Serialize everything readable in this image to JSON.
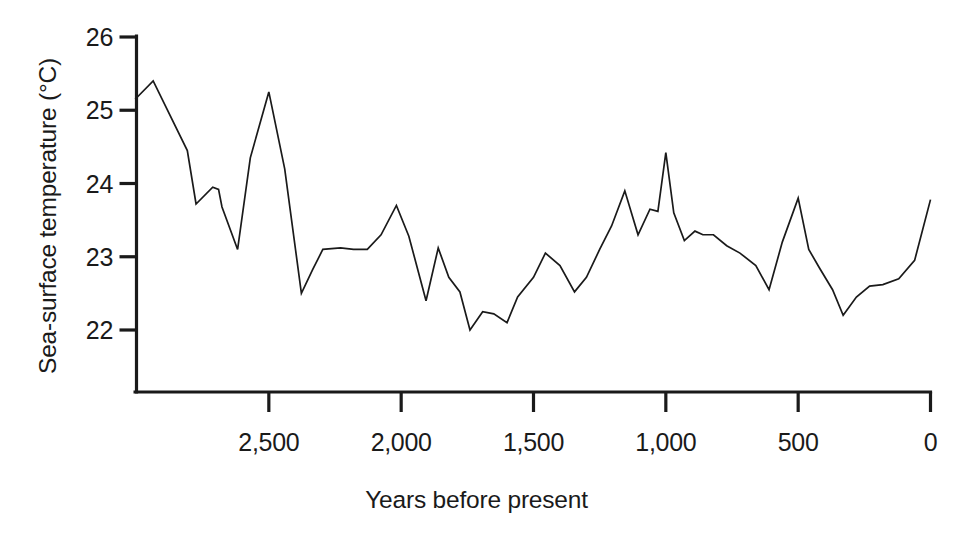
{
  "chart_data": {
    "type": "line",
    "title": "",
    "subtitle": "",
    "xlabel": "Years before present",
    "ylabel": "Sea-surface temperature (°C)",
    "x_tick_labels": [
      "2,500",
      "2,000",
      "1,500",
      "1,000",
      "500",
      "0"
    ],
    "x_tick_values": [
      2500,
      2000,
      1500,
      1000,
      500,
      0
    ],
    "y_tick_labels": [
      "26",
      "25",
      "24",
      "23",
      "22"
    ],
    "y_tick_values": [
      26,
      25,
      24,
      23,
      22
    ],
    "xlim": [
      3000,
      0
    ],
    "ylim": [
      21.4,
      26.2
    ],
    "x_axis_inverted": true,
    "grid": false,
    "legend": null,
    "line_color": "#1a1a1a",
    "background_color": "#ffffff",
    "series": [
      {
        "name": "Sea-surface temperature",
        "x": [
          3005,
          2937,
          2808,
          2775,
          2712,
          2690,
          2677,
          2618,
          2570,
          2500,
          2440,
          2377,
          2335,
          2296,
          2229,
          2180,
          2128,
          2076,
          2018,
          1971,
          1906,
          1860,
          1820,
          1778,
          1740,
          1692,
          1650,
          1600,
          1560,
          1500,
          1455,
          1400,
          1345,
          1300,
          1250,
          1205,
          1155,
          1105,
          1060,
          1030,
          1000,
          970,
          930,
          890,
          860,
          820,
          770,
          720,
          660,
          610,
          560,
          500,
          460,
          420,
          370,
          330,
          280,
          230,
          180,
          120,
          60,
          0
        ],
        "y": [
          25.15,
          25.4,
          24.45,
          23.72,
          23.95,
          23.92,
          23.68,
          23.1,
          24.35,
          25.25,
          24.2,
          22.5,
          22.82,
          23.1,
          23.12,
          23.1,
          23.1,
          23.3,
          23.7,
          23.28,
          22.4,
          23.12,
          22.72,
          22.52,
          22.0,
          22.25,
          22.22,
          22.1,
          22.45,
          22.72,
          23.05,
          22.88,
          22.52,
          22.72,
          23.1,
          23.42,
          23.9,
          23.3,
          23.65,
          23.62,
          24.42,
          23.6,
          23.22,
          23.35,
          23.3,
          23.3,
          23.15,
          23.05,
          22.88,
          22.55,
          23.2,
          23.8,
          23.1,
          22.85,
          22.55,
          22.2,
          22.45,
          22.6,
          22.62,
          22.7,
          22.95,
          23.78
        ]
      }
    ]
  },
  "axis": {
    "y_axis_name": "y-axis",
    "x_axis_name": "x-axis"
  }
}
